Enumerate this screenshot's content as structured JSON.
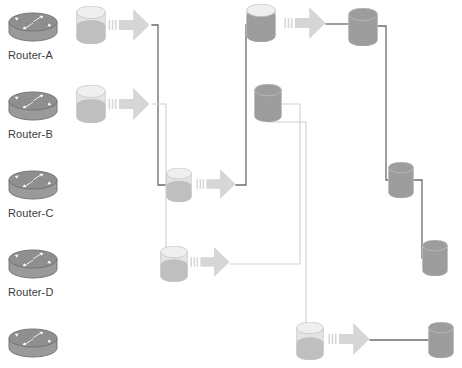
{
  "diagram": {
    "background_color": "#ffffff",
    "width": 462,
    "height": 368,
    "palette": {
      "router_body": "#9a9a9a",
      "router_top": "#8f8f8f",
      "router_outline": "#6e6e6e",
      "cylinder_empty": "#e3e3e3",
      "cylinder_fill_light": "#bfbfbf",
      "cylinder_fill_dark": "#9d9d9d",
      "arrow_fill": "#d6d6d6",
      "wire_dark": "#6b6b6b",
      "wire_light": "#cfcfcf",
      "label_text": "#3b3b3b"
    }
  },
  "routers": [
    {
      "icon": "router-icon",
      "label": "Router-A",
      "x": 6,
      "y": 6,
      "label_x": 8,
      "label_y": 49
    },
    {
      "icon": "router-icon",
      "label": "Router-B",
      "x": 6,
      "y": 85,
      "label_x": 8,
      "label_y": 128
    },
    {
      "icon": "router-icon",
      "label": "Router-C",
      "x": 6,
      "y": 164,
      "label_x": 8,
      "label_y": 207
    },
    {
      "icon": "router-icon",
      "label": "Router-D",
      "x": 6,
      "y": 243,
      "label_x": 8,
      "label_y": 286
    },
    {
      "icon": "router-icon",
      "label": "",
      "x": 6,
      "y": 322,
      "label_x": 8,
      "label_y": 365
    }
  ],
  "cylinders": [
    {
      "name": "buffer-a",
      "x": 76,
      "y": 6,
      "w": 30,
      "h": 38,
      "fill": 0.45,
      "tone": "light"
    },
    {
      "name": "buffer-b",
      "x": 76,
      "y": 85,
      "w": 30,
      "h": 38,
      "fill": 0.45,
      "tone": "light"
    },
    {
      "name": "buffer-mid-upper",
      "x": 166,
      "y": 168,
      "w": 26,
      "h": 34,
      "fill": 0.45,
      "tone": "light"
    },
    {
      "name": "buffer-mid-lower",
      "x": 160,
      "y": 246,
      "w": 28,
      "h": 36,
      "fill": 0.45,
      "tone": "light"
    },
    {
      "name": "buffer-top-center",
      "x": 246,
      "y": 4,
      "w": 30,
      "h": 38,
      "fill": 0.8,
      "tone": "dark"
    },
    {
      "name": "store-center",
      "x": 254,
      "y": 84,
      "w": 28,
      "h": 38,
      "fill": 1.0,
      "tone": "dark"
    },
    {
      "name": "store-top-right",
      "x": 348,
      "y": 8,
      "w": 30,
      "h": 38,
      "fill": 1.0,
      "tone": "dark"
    },
    {
      "name": "store-mid-right",
      "x": 388,
      "y": 162,
      "w": 26,
      "h": 36,
      "fill": 1.0,
      "tone": "dark"
    },
    {
      "name": "store-lower-right",
      "x": 422,
      "y": 240,
      "w": 26,
      "h": 36,
      "fill": 1.0,
      "tone": "dark"
    },
    {
      "name": "buffer-bottom",
      "x": 296,
      "y": 322,
      "w": 28,
      "h": 38,
      "fill": 0.42,
      "tone": "light"
    },
    {
      "name": "store-bottom-right",
      "x": 428,
      "y": 322,
      "w": 26,
      "h": 36,
      "fill": 1.0,
      "tone": "dark"
    }
  ],
  "arrows": [
    {
      "name": "flow-arrow-a",
      "x": 108,
      "y": 8,
      "w": 42,
      "h": 34
    },
    {
      "name": "flow-arrow-b",
      "x": 108,
      "y": 87,
      "w": 42,
      "h": 34
    },
    {
      "name": "flow-arrow-mid-up",
      "x": 196,
      "y": 168,
      "w": 40,
      "h": 32
    },
    {
      "name": "flow-arrow-mid-low",
      "x": 190,
      "y": 246,
      "w": 40,
      "h": 32
    },
    {
      "name": "flow-arrow-top",
      "x": 284,
      "y": 6,
      "w": 42,
      "h": 34
    },
    {
      "name": "flow-arrow-bottom",
      "x": 328,
      "y": 322,
      "w": 42,
      "h": 34
    }
  ],
  "connectors": [
    {
      "name": "wire-a-to-mid-upper",
      "tone": "dark",
      "points": "152,25 158,25 158,185 172,185"
    },
    {
      "name": "wire-b-to-mid-lower",
      "tone": "light",
      "points": "152,104 166,104 166,264 168,264"
    },
    {
      "name": "wire-mid-upper-out",
      "tone": "dark",
      "points": "236,185 246,185 246,25 252,25"
    },
    {
      "name": "wire-mid-lower-out",
      "tone": "light",
      "points": "230,264 300,264 300,104 262,104"
    },
    {
      "name": "wire-top-to-store",
      "tone": "dark",
      "points": "326,24 356,24"
    },
    {
      "name": "wire-store-top-down",
      "tone": "dark",
      "points": "378,26 386,26 386,180 396,180"
    },
    {
      "name": "wire-store-mid-down",
      "tone": "dark",
      "points": "414,180 422,180 422,258 428,258"
    },
    {
      "name": "wire-center-to-bottom",
      "tone": "light",
      "points": "268,122 306,122 306,340 302,340"
    },
    {
      "name": "wire-bottom-to-store",
      "tone": "dark",
      "points": "370,340 434,340"
    }
  ]
}
